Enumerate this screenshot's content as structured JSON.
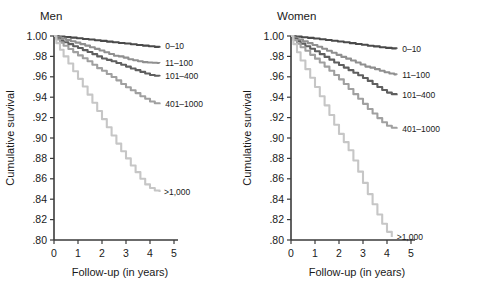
{
  "figure": {
    "background": "#ffffff",
    "axis_color": "#3a3a3a"
  },
  "panels": {
    "men": {
      "title": "Men"
    },
    "women": {
      "title": "Women"
    }
  },
  "axes": {
    "ylabel": "Cumulative survival",
    "xlabel": "Follow-up (in years)",
    "ylim": [
      0.8,
      1.0
    ],
    "xlim": [
      0,
      5
    ],
    "ytick_labels": [
      "1.00",
      ".98",
      ".96",
      ".94",
      ".92",
      ".90",
      ".88",
      ".86",
      ".84",
      ".82",
      ".80"
    ],
    "ytick_values": [
      1.0,
      0.98,
      0.96,
      0.94,
      0.92,
      0.9,
      0.88,
      0.86,
      0.84,
      0.82,
      0.8
    ],
    "xtick_labels": [
      "0",
      "1",
      "2",
      "3",
      "4",
      "5"
    ],
    "xtick_values": [
      0,
      1,
      2,
      3,
      4,
      5
    ],
    "grid": false
  },
  "series_labels": [
    "0–10",
    "11–100",
    "101–400",
    "401–1000",
    ">1,000"
  ],
  "series_colors": [
    "#4a4a4a",
    "#8f8f8f",
    "#5f5f5f",
    "#a0a0a0",
    "#c6c6c6"
  ],
  "chart_data": {
    "type": "line",
    "xlabel": "Follow-up (in years)",
    "ylabel": "Cumulative survival",
    "xlim": [
      0,
      5
    ],
    "ylim": [
      0.8,
      1.0
    ],
    "grid": false,
    "legend_position": "right-of-curve-ends",
    "panels": [
      {
        "name": "Men",
        "series": [
          {
            "name": "0–10",
            "color": "#4a4a4a",
            "label_x": 4.55,
            "label_y": 0.99,
            "x": [
              0.0,
              0.2,
              0.45,
              0.7,
              0.95,
              1.2,
              1.45,
              1.7,
              1.95,
              2.2,
              2.45,
              2.7,
              2.95,
              3.2,
              3.45,
              3.7,
              3.95,
              4.2,
              4.4
            ],
            "y": [
              1.0,
              0.9995,
              0.999,
              0.9984,
              0.9978,
              0.9971,
              0.9965,
              0.9958,
              0.9952,
              0.9945,
              0.9939,
              0.9932,
              0.9926,
              0.9919,
              0.9912,
              0.9906,
              0.9899,
              0.9893,
              0.9888
            ]
          },
          {
            "name": "11–100",
            "color": "#8f8f8f",
            "label_x": 4.55,
            "label_y": 0.9735,
            "x": [
              0.0,
              0.15,
              0.3,
              0.5,
              0.7,
              0.9,
              1.1,
              1.3,
              1.5,
              1.7,
              1.9,
              2.1,
              2.3,
              2.5,
              2.7,
              2.9,
              3.1,
              3.3,
              3.5,
              3.7,
              3.9,
              4.1,
              4.3,
              4.4
            ],
            "y": [
              1.0,
              0.9988,
              0.9975,
              0.9962,
              0.9948,
              0.9935,
              0.992,
              0.9906,
              0.989,
              0.9874,
              0.9858,
              0.9841,
              0.9824,
              0.9806,
              0.98,
              0.9788,
              0.9772,
              0.9762,
              0.9752,
              0.9744,
              0.974,
              0.9738,
              0.9736,
              0.9735
            ]
          },
          {
            "name": "101–400",
            "color": "#5f5f5f",
            "label_x": 4.55,
            "label_y": 0.9605,
            "x": [
              0.0,
              0.12,
              0.25,
              0.4,
              0.6,
              0.8,
              1.0,
              1.2,
              1.4,
              1.6,
              1.8,
              2.0,
              2.2,
              2.4,
              2.6,
              2.8,
              3.0,
              3.2,
              3.4,
              3.6,
              3.8,
              4.0,
              4.2,
              4.4
            ],
            "y": [
              1.0,
              0.9975,
              0.9955,
              0.9938,
              0.992,
              0.99,
              0.9882,
              0.9862,
              0.9843,
              0.9822,
              0.98,
              0.978,
              0.9766,
              0.9752,
              0.9736,
              0.9718,
              0.97,
              0.9682,
              0.9665,
              0.9648,
              0.9632,
              0.9618,
              0.961,
              0.9605
            ]
          },
          {
            "name": "401–1000",
            "color": "#a0a0a0",
            "label_x": 4.55,
            "label_y": 0.933,
            "x": [
              0.0,
              0.1,
              0.25,
              0.4,
              0.6,
              0.8,
              1.0,
              1.2,
              1.4,
              1.6,
              1.8,
              2.0,
              2.2,
              2.4,
              2.6,
              2.8,
              3.0,
              3.2,
              3.4,
              3.6,
              3.8,
              4.0,
              4.2,
              4.4
            ],
            "y": [
              1.0,
              0.9965,
              0.9935,
              0.9905,
              0.9872,
              0.9842,
              0.981,
              0.9782,
              0.9752,
              0.9718,
              0.9685,
              0.966,
              0.9628,
              0.9598,
              0.9565,
              0.953,
              0.9498,
              0.9468,
              0.944,
              0.941,
              0.9385,
              0.9358,
              0.934,
              0.933
            ]
          },
          {
            "name": ">1,000",
            "color": "#c6c6c6",
            "label_x": 4.5,
            "label_y": 0.847,
            "x": [
              0.0,
              0.1,
              0.25,
              0.4,
              0.6,
              0.8,
              1.0,
              1.2,
              1.4,
              1.6,
              1.8,
              2.0,
              2.2,
              2.4,
              2.6,
              2.8,
              3.0,
              3.2,
              3.4,
              3.6,
              3.8,
              4.0,
              4.2,
              4.4
            ],
            "y": [
              1.0,
              0.993,
              0.9865,
              0.98,
              0.973,
              0.9655,
              0.958,
              0.9505,
              0.9425,
              0.9345,
              0.9265,
              0.9185,
              0.9105,
              0.9025,
              0.8945,
              0.887,
              0.88,
              0.873,
              0.8665,
              0.86,
              0.8545,
              0.851,
              0.8485,
              0.847
            ]
          }
        ]
      },
      {
        "name": "Women",
        "series": [
          {
            "name": "0–10",
            "color": "#4a4a4a",
            "label_x": 4.55,
            "label_y": 0.9875,
            "x": [
              0.0,
              0.2,
              0.45,
              0.7,
              0.95,
              1.2,
              1.45,
              1.7,
              1.95,
              2.2,
              2.45,
              2.7,
              2.95,
              3.2,
              3.45,
              3.7,
              3.95,
              4.2,
              4.4
            ],
            "y": [
              1.0,
              0.9994,
              0.9988,
              0.9982,
              0.9975,
              0.9968,
              0.9961,
              0.9954,
              0.9946,
              0.9938,
              0.993,
              0.9922,
              0.9914,
              0.9905,
              0.9898,
              0.989,
              0.9884,
              0.9879,
              0.9875
            ]
          },
          {
            "name": "11–100",
            "color": "#8f8f8f",
            "label_x": 4.55,
            "label_y": 0.962,
            "x": [
              0.0,
              0.15,
              0.3,
              0.5,
              0.7,
              0.9,
              1.1,
              1.3,
              1.5,
              1.7,
              1.9,
              2.1,
              2.3,
              2.5,
              2.7,
              2.9,
              3.1,
              3.3,
              3.5,
              3.7,
              3.9,
              4.1,
              4.3,
              4.4
            ],
            "y": [
              1.0,
              0.9982,
              0.9965,
              0.9948,
              0.993,
              0.9912,
              0.9894,
              0.9875,
              0.9856,
              0.9836,
              0.9815,
              0.9795,
              0.9778,
              0.976,
              0.974,
              0.972,
              0.97,
              0.969,
              0.9675,
              0.966,
              0.9645,
              0.9632,
              0.9624,
              0.962
            ]
          },
          {
            "name": "101–400",
            "color": "#5f5f5f",
            "label_x": 4.55,
            "label_y": 0.942,
            "x": [
              0.0,
              0.12,
              0.25,
              0.4,
              0.6,
              0.8,
              1.0,
              1.2,
              1.4,
              1.6,
              1.8,
              2.0,
              2.2,
              2.4,
              2.6,
              2.8,
              3.0,
              3.2,
              3.4,
              3.6,
              3.8,
              4.0,
              4.2,
              4.4
            ],
            "y": [
              1.0,
              0.9972,
              0.9948,
              0.9925,
              0.99,
              0.9875,
              0.985,
              0.9822,
              0.9795,
              0.9768,
              0.974,
              0.9715,
              0.969,
              0.9665,
              0.964,
              0.9615,
              0.9588,
              0.956,
              0.953,
              0.95,
              0.947,
              0.9445,
              0.943,
              0.942
            ]
          },
          {
            "name": "401–1000",
            "color": "#a0a0a0",
            "label_x": 4.55,
            "label_y": 0.909,
            "x": [
              0.0,
              0.1,
              0.25,
              0.4,
              0.6,
              0.8,
              1.0,
              1.2,
              1.4,
              1.6,
              1.8,
              2.0,
              2.2,
              2.4,
              2.6,
              2.8,
              3.0,
              3.2,
              3.4,
              3.6,
              3.8,
              4.0,
              4.2,
              4.4
            ],
            "y": [
              1.0,
              0.996,
              0.9925,
              0.989,
              0.9855,
              0.9815,
              0.9778,
              0.974,
              0.97,
              0.966,
              0.9618,
              0.9575,
              0.953,
              0.948,
              0.943,
              0.9385,
              0.9335,
              0.9285,
              0.924,
              0.9195,
              0.9155,
              0.912,
              0.91,
              0.909
            ]
          },
          {
            "name": ">1,000",
            "color": "#c6c6c6",
            "label_x": 4.32,
            "label_y": 0.803,
            "x": [
              0.0,
              0.1,
              0.25,
              0.4,
              0.6,
              0.8,
              1.0,
              1.2,
              1.4,
              1.6,
              1.8,
              2.0,
              2.2,
              2.4,
              2.6,
              2.8,
              3.0,
              3.2,
              3.4,
              3.6,
              3.8,
              4.0,
              4.2
            ],
            "y": [
              1.0,
              0.992,
              0.984,
              0.976,
              0.9675,
              0.959,
              0.95,
              0.941,
              0.932,
              0.9225,
              0.913,
              0.904,
              0.896,
              0.888,
              0.878,
              0.867,
              0.856,
              0.845,
              0.835,
              0.825,
              0.816,
              0.808,
              0.803
            ]
          }
        ]
      }
    ]
  }
}
